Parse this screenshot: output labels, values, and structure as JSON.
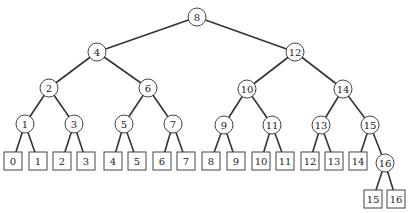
{
  "diagram": {
    "type": "binary-search-tree",
    "colors": {
      "stroke": "#333333",
      "background": "#ffffff",
      "text": "#222222"
    },
    "internal_nodes": [
      {
        "id": "n8",
        "label": "8",
        "x": 197,
        "y": 17
      },
      {
        "id": "n4",
        "label": "4",
        "x": 97,
        "y": 52
      },
      {
        "id": "n12",
        "label": "12",
        "x": 295,
        "y": 52
      },
      {
        "id": "n2",
        "label": "2",
        "x": 49,
        "y": 88
      },
      {
        "id": "n6",
        "label": "6",
        "x": 148,
        "y": 88
      },
      {
        "id": "n10",
        "label": "10",
        "x": 247,
        "y": 89
      },
      {
        "id": "n14",
        "label": "14",
        "x": 343,
        "y": 89
      },
      {
        "id": "n1",
        "label": "1",
        "x": 25,
        "y": 124
      },
      {
        "id": "n3",
        "label": "3",
        "x": 74,
        "y": 124
      },
      {
        "id": "n5",
        "label": "5",
        "x": 124,
        "y": 124
      },
      {
        "id": "n7",
        "label": "7",
        "x": 173,
        "y": 124
      },
      {
        "id": "n9",
        "label": "9",
        "x": 224,
        "y": 125
      },
      {
        "id": "n11",
        "label": "11",
        "x": 272,
        "y": 125
      },
      {
        "id": "n13",
        "label": "13",
        "x": 321,
        "y": 125
      },
      {
        "id": "n15",
        "label": "15",
        "x": 370,
        "y": 125
      },
      {
        "id": "n16",
        "label": "16",
        "x": 385,
        "y": 163
      }
    ],
    "leaf_nodes": [
      {
        "id": "l0",
        "label": "0",
        "x": 13,
        "y": 161
      },
      {
        "id": "l1",
        "label": "1",
        "x": 38,
        "y": 161
      },
      {
        "id": "l2",
        "label": "2",
        "x": 62,
        "y": 161
      },
      {
        "id": "l3",
        "label": "3",
        "x": 86,
        "y": 161
      },
      {
        "id": "l4",
        "label": "4",
        "x": 113,
        "y": 161
      },
      {
        "id": "l5",
        "label": "5",
        "x": 137,
        "y": 161
      },
      {
        "id": "l6",
        "label": "6",
        "x": 162,
        "y": 161
      },
      {
        "id": "l7",
        "label": "7",
        "x": 186,
        "y": 161
      },
      {
        "id": "l8",
        "label": "8",
        "x": 211,
        "y": 161
      },
      {
        "id": "l9",
        "label": "9",
        "x": 236,
        "y": 161
      },
      {
        "id": "l10",
        "label": "10",
        "x": 261,
        "y": 161
      },
      {
        "id": "l11",
        "label": "11",
        "x": 285,
        "y": 161
      },
      {
        "id": "l12",
        "label": "12",
        "x": 310,
        "y": 161
      },
      {
        "id": "l13",
        "label": "13",
        "x": 334,
        "y": 161
      },
      {
        "id": "l14",
        "label": "14",
        "x": 358,
        "y": 161
      },
      {
        "id": "l15",
        "label": "15",
        "x": 373,
        "y": 199
      },
      {
        "id": "l16",
        "label": "16",
        "x": 396,
        "y": 199
      }
    ],
    "edges": [
      [
        "n8",
        "n4"
      ],
      [
        "n8",
        "n12"
      ],
      [
        "n4",
        "n2"
      ],
      [
        "n4",
        "n6"
      ],
      [
        "n12",
        "n10"
      ],
      [
        "n12",
        "n14"
      ],
      [
        "n2",
        "n1"
      ],
      [
        "n2",
        "n3"
      ],
      [
        "n6",
        "n5"
      ],
      [
        "n6",
        "n7"
      ],
      [
        "n10",
        "n9"
      ],
      [
        "n10",
        "n11"
      ],
      [
        "n14",
        "n13"
      ],
      [
        "n14",
        "n15"
      ],
      [
        "n1",
        "l0"
      ],
      [
        "n1",
        "l1"
      ],
      [
        "n3",
        "l2"
      ],
      [
        "n3",
        "l3"
      ],
      [
        "n5",
        "l4"
      ],
      [
        "n5",
        "l5"
      ],
      [
        "n7",
        "l6"
      ],
      [
        "n7",
        "l7"
      ],
      [
        "n9",
        "l8"
      ],
      [
        "n9",
        "l9"
      ],
      [
        "n11",
        "l10"
      ],
      [
        "n11",
        "l11"
      ],
      [
        "n13",
        "l12"
      ],
      [
        "n13",
        "l13"
      ],
      [
        "n15",
        "l14"
      ],
      [
        "n15",
        "n16"
      ],
      [
        "n16",
        "l15"
      ],
      [
        "n16",
        "l16"
      ]
    ]
  }
}
